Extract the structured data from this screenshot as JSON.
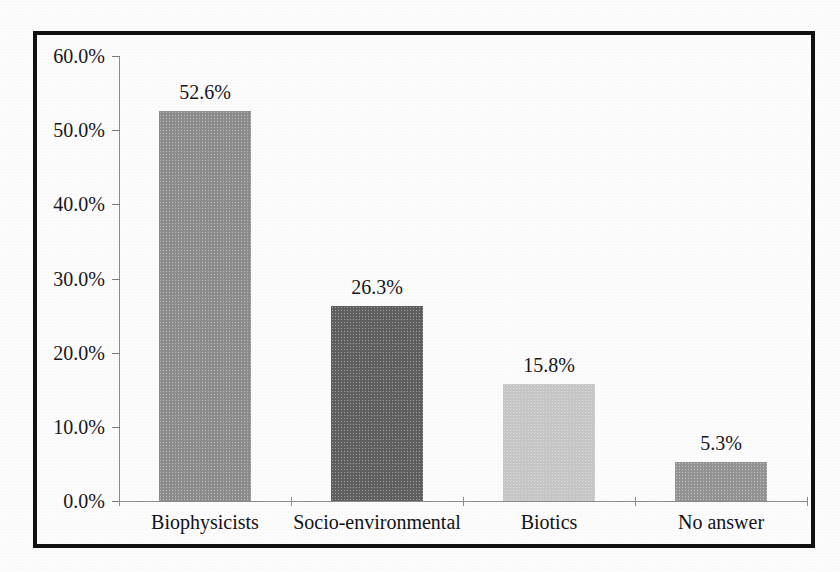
{
  "figure": {
    "frame_color": "#121212",
    "background_color": "#ffffff"
  },
  "chart_data": {
    "type": "bar",
    "title": "",
    "subtitle": "",
    "xlabel": "",
    "ylabel": "",
    "categories": [
      "Biophysicists",
      "Socio-environmental",
      "Biotics",
      "No answer"
    ],
    "values": [
      52.6,
      26.3,
      15.8,
      5.3
    ],
    "value_labels": [
      "52.6%",
      "26.3%",
      "15.8%",
      "5.3%"
    ],
    "bar_colors": [
      "#8e8e8e",
      "#606060",
      "#c8c8c8",
      "#959595"
    ],
    "ylim": [
      0,
      60
    ],
    "ytick_values": [
      0,
      10,
      20,
      30,
      40,
      50,
      60
    ],
    "ytick_labels": [
      "0.0%",
      "10.0%",
      "20.0%",
      "30.0%",
      "40.0%",
      "50.0%",
      "60.0%"
    ],
    "grid": false,
    "legend": false,
    "legend_position": "none",
    "axis_color": "#8d8d8d",
    "text_color": "#17171a"
  }
}
